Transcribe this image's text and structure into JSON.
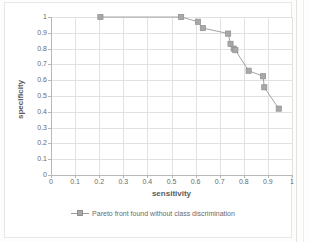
{
  "chart_data": {
    "type": "line",
    "title": "",
    "xlabel": "sensitivity",
    "ylabel": "specificity",
    "xlim": [
      0,
      1
    ],
    "ylim": [
      0,
      1
    ],
    "grid": true,
    "legend_position": "bottom",
    "xticks": [
      "0",
      "0.1",
      "0.2",
      "0.3",
      "0.4",
      "0.5",
      "0.6",
      "0.7",
      "0.8",
      "0.9",
      "1"
    ],
    "yticks": [
      "0",
      "0.1",
      "0.2",
      "0.3",
      "0.4",
      "0.5",
      "0.6",
      "0.7",
      "0.8",
      "0.9",
      "1"
    ],
    "series": [
      {
        "name": "Pareto front found without class discrimination",
        "marker": "square",
        "color": "#a8a8a8",
        "line_color": "#9a9a9a",
        "x": [
          0.205,
          0.54,
          0.61,
          0.63,
          0.735,
          0.745,
          0.758,
          0.765,
          0.82,
          0.88,
          0.885,
          0.945
        ],
        "y": [
          1.0,
          1.0,
          0.97,
          0.93,
          0.895,
          0.83,
          0.8,
          0.79,
          0.66,
          0.625,
          0.555,
          0.42
        ]
      }
    ]
  },
  "legend": {
    "entry_label": "Pareto front found without class discrimination"
  },
  "axes": {
    "x_title": "sensitivity",
    "y_title": "specificity"
  }
}
